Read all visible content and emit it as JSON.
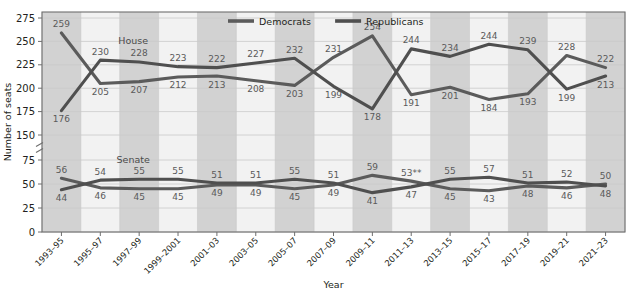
{
  "chart_data": {
    "type": "line",
    "title": "",
    "xlabel": "Year",
    "ylabel": "Number of seats",
    "grid": true,
    "legend_position": "top-center",
    "axis_break": true,
    "yticks": [
      0,
      25,
      50,
      75,
      150,
      175,
      200,
      225,
      250,
      275
    ],
    "ytick_labels": [
      "0",
      "25",
      "50",
      "75",
      "150",
      "175",
      "200",
      "225",
      "250",
      "275"
    ],
    "categories": [
      "1993–95",
      "1995–97",
      "1997–99",
      "1999–2001",
      "2001–03",
      "2003–05",
      "2005–07",
      "2007–09",
      "2009–11",
      "2011–13",
      "2013–15",
      "2015–17",
      "2017–19",
      "2019–21",
      "2021–23"
    ],
    "panels": [
      {
        "name": "House",
        "label": "House",
        "series": [
          {
            "name": "Democrats",
            "values": [
              259,
              205,
              207,
              212,
              213,
              208,
              203,
              233,
              256,
              193,
              201,
              188,
              194,
              235,
              222
            ],
            "labels": [
              "259",
              "205",
              "207",
              "212",
              "213",
              "208",
              "203",
              "231",
              "254",
              "191",
              "201",
              "184",
              "193",
              "228",
              "222"
            ]
          },
          {
            "name": "Republicans",
            "values": [
              176,
              230,
              228,
              223,
              222,
              227,
              232,
              202,
              178,
              242,
              234,
              247,
              241,
              199,
              213
            ],
            "labels": [
              "176",
              "230",
              "228",
              "223",
              "222",
              "227",
              "232",
              "199",
              "178",
              "244",
              "234",
              "244",
              "239",
              "199",
              "213"
            ]
          }
        ]
      },
      {
        "name": "Senate",
        "label": "Senate",
        "series": [
          {
            "name": "Democrats",
            "values": [
              56,
              46,
              45,
              45,
              49,
              49,
              45,
              49,
              59,
              53,
              45,
              43,
              48,
              46,
              50
            ],
            "labels": [
              "56",
              "46",
              "45",
              "45",
              "49",
              "49",
              "45",
              "49",
              "59",
              "53**",
              "45",
              "43",
              "48",
              "46",
              "50"
            ]
          },
          {
            "name": "Republicans",
            "values": [
              44,
              54,
              55,
              55,
              51,
              51,
              55,
              51,
              41,
              47,
              55,
              57,
              51,
              52,
              48
            ],
            "labels": [
              "44",
              "54",
              "55",
              "55",
              "51",
              "51",
              "55",
              "51",
              "41",
              "47",
              "55",
              "57",
              "51",
              "52",
              "48"
            ]
          }
        ]
      }
    ],
    "legend": [
      {
        "label": "Democrats",
        "color": "#5b5b5b"
      },
      {
        "label": "Republicans",
        "color": "#4f4f4f"
      }
    ],
    "colors": {
      "democrats": "#5b5b5b",
      "republicans": "#4f4f4f",
      "band": "#d2d2d2",
      "plot_background": "#f2f2f2",
      "grid": "#c9c9c9",
      "axis": "#6e6e6e",
      "value_label": "#5a5a5a"
    }
  }
}
